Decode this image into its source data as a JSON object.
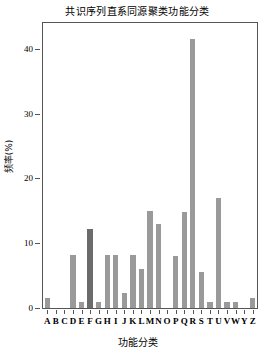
{
  "chart_data": {
    "type": "bar",
    "title": "共识序列直系同源聚类功能分类",
    "xlabel": "功能分类",
    "ylabel": "频率(%)",
    "categories": [
      "A",
      "B",
      "C",
      "D",
      "E",
      "F",
      "G",
      "H",
      "I",
      "J",
      "K",
      "L",
      "M",
      "N",
      "O",
      "P",
      "Q",
      "R",
      "S",
      "T",
      "U",
      "V",
      "W",
      "Y",
      "Z"
    ],
    "values": [
      1.5,
      0,
      0,
      8.2,
      1.0,
      12.2,
      1.0,
      8.2,
      8.2,
      2.3,
      8.2,
      6.0,
      15.0,
      13.0,
      0,
      8.0,
      14.8,
      41.5,
      5.5,
      1.0,
      17.0,
      1.0,
      1.0,
      0,
      1.5
    ],
    "bar_colors": [
      "#9a9a9a",
      "#9a9a9a",
      "#9a9a9a",
      "#9a9a9a",
      "#9a9a9a",
      "#6b6b6b",
      "#9a9a9a",
      "#9a9a9a",
      "#9a9a9a",
      "#9a9a9a",
      "#9a9a9a",
      "#9a9a9a",
      "#9a9a9a",
      "#9a9a9a",
      "#9a9a9a",
      "#9a9a9a",
      "#9a9a9a",
      "#9a9a9a",
      "#9a9a9a",
      "#9a9a9a",
      "#9a9a9a",
      "#9a9a9a",
      "#9a9a9a",
      "#9a9a9a",
      "#9a9a9a"
    ],
    "ylim": [
      0,
      44
    ],
    "yticks": [
      0,
      10,
      20,
      30,
      40
    ],
    "ytick_labels": [
      "0",
      "10",
      "20",
      "30",
      "40"
    ],
    "grid": false,
    "legend": null,
    "accent_color": "#9a9a9a",
    "highlight_color": "#6b6b6b",
    "frame_color": "#555555"
  }
}
